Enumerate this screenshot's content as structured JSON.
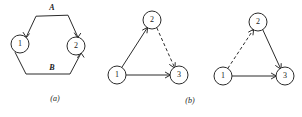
{
  "figure": {
    "name": "graph-reduction-figure",
    "background_color": "#ffffff",
    "stroke_color": "#2b2b2b",
    "panels": [
      {
        "id": "panel-a",
        "caption": "(a)",
        "caption_x": 55,
        "caption_y": 99,
        "type": "two-node-hexagon",
        "nodes": [
          {
            "id": "a-node-1",
            "label": "1",
            "cx": 20,
            "cy": 44,
            "r": 9
          },
          {
            "id": "a-node-2",
            "label": "2",
            "cx": 76,
            "cy": 46,
            "r": 9
          }
        ],
        "edge_labels": [
          {
            "id": "a-label-A",
            "text": "A",
            "x": 52,
            "y": 8
          },
          {
            "id": "a-label-B",
            "text": "B",
            "x": 52,
            "y": 70
          }
        ],
        "paths": [
          {
            "id": "a-path-A",
            "label": "A",
            "style": "solid",
            "points": "26,37 36,16 68,15 78,37",
            "arrows": [
              {
                "at_x": 26.5,
                "at_y": 37.0,
                "angle": 295
              },
              {
                "at_x": 77.5,
                "at_y": 37.5,
                "angle": 245
              }
            ]
          },
          {
            "id": "a-path-B",
            "label": "B",
            "style": "solid",
            "points": "15,52 26,74 70,74 81,53",
            "arrows": [
              {
                "at_x": 80.5,
                "at_y": 54.0,
                "angle": 115
              }
            ]
          }
        ]
      },
      {
        "id": "panel-b",
        "caption": "(b)",
        "caption_x": 190,
        "caption_y": 101,
        "type": "two-triangles",
        "triangles": [
          {
            "id": "b-triangle-left",
            "nodes": [
              {
                "id": "b1-node-2",
                "label": "2",
                "cx": 152,
                "cy": 20,
                "r": 9
              },
              {
                "id": "b1-node-1",
                "label": "1",
                "cx": 117,
                "cy": 75,
                "r": 9
              },
              {
                "id": "b1-node-3",
                "label": "3",
                "cx": 179,
                "cy": 75,
                "r": 9
              }
            ],
            "edges": [
              {
                "id": "b1-edge-1-2",
                "from": "1",
                "to": "2",
                "style": "solid",
                "arrow": true
              },
              {
                "id": "b1-edge-2-3",
                "from": "2",
                "to": "3",
                "style": "dashed",
                "arrow": true
              },
              {
                "id": "b1-edge-1-3",
                "from": "1",
                "to": "3",
                "style": "solid",
                "arrow": true
              }
            ]
          },
          {
            "id": "b-triangle-right",
            "nodes": [
              {
                "id": "b2-node-2",
                "label": "2",
                "cx": 258,
                "cy": 22,
                "r": 9
              },
              {
                "id": "b2-node-1",
                "label": "1",
                "cx": 223,
                "cy": 76,
                "r": 9
              },
              {
                "id": "b2-node-3",
                "label": "3",
                "cx": 285,
                "cy": 76,
                "r": 9
              }
            ],
            "edges": [
              {
                "id": "b2-edge-1-2",
                "from": "1",
                "to": "2",
                "style": "dashed",
                "arrow": true
              },
              {
                "id": "b2-edge-2-3",
                "from": "2",
                "to": "3",
                "style": "solid",
                "arrow": true
              },
              {
                "id": "b2-edge-1-3",
                "from": "1",
                "to": "3",
                "style": "solid",
                "arrow": true
              }
            ]
          }
        ]
      }
    ],
    "labels": {
      "a_node_1": "1",
      "a_node_2": "2",
      "a_edge_top": "A",
      "a_edge_bottom": "B",
      "caption_a": "(a)",
      "caption_b": "(b)",
      "b1_node_1": "1",
      "b1_node_2": "2",
      "b1_node_3": "3",
      "b2_node_1": "1",
      "b2_node_2": "2",
      "b2_node_3": "3"
    }
  }
}
